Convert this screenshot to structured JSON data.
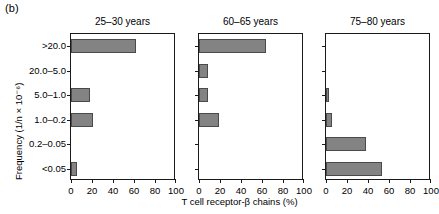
{
  "figure": {
    "panel_label": "(b)",
    "y_axis_title": "Frequency (1/n × 10⁻⁶)",
    "x_axis_title": "T cell receptor-β chains (%)",
    "bar_color": "#838383",
    "bar_edge_color": "#4a4a4a",
    "axis_color": "#1a1a1a"
  },
  "chart_data": {
    "type": "bar",
    "orientation": "horizontal",
    "title": "",
    "xlabel": "T cell receptor-β chains (%)",
    "ylabel": "Frequency (1/n × 10⁻⁶)",
    "xlim": [
      0,
      100
    ],
    "xticks": [
      0,
      20,
      40,
      60,
      80,
      100
    ],
    "xticklabels": [
      "0",
      "20",
      "40",
      "60",
      "80",
      "100"
    ],
    "categories": [
      ">20.0",
      "20.0–5.0",
      "5.0–1.0",
      "1.0–0.2",
      "0.2–0.05",
      "<0.05"
    ],
    "grid": false,
    "legend": "none",
    "panels": [
      {
        "title": "25–30 years",
        "values": [
          62,
          0,
          18,
          21,
          0,
          6
        ]
      },
      {
        "title": "60–65 years",
        "values": [
          64,
          9,
          9,
          19,
          0,
          0
        ]
      },
      {
        "title": "75–80 years",
        "values": [
          0,
          0,
          3,
          6,
          38,
          53
        ]
      }
    ]
  }
}
